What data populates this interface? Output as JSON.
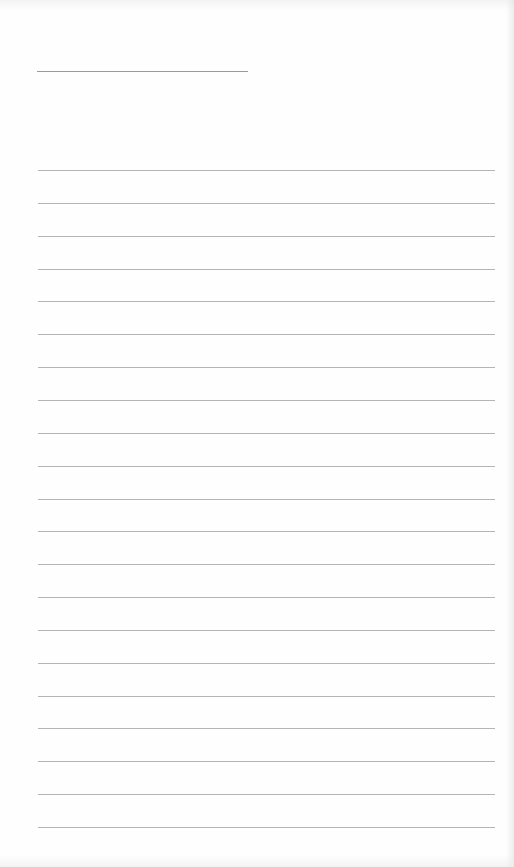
{
  "document": {
    "type": "lined-writing-page",
    "header_line": {
      "label": ""
    },
    "rule_count": 21,
    "rules": [
      {
        "index": 1,
        "text": ""
      },
      {
        "index": 2,
        "text": ""
      },
      {
        "index": 3,
        "text": ""
      },
      {
        "index": 4,
        "text": ""
      },
      {
        "index": 5,
        "text": ""
      },
      {
        "index": 6,
        "text": ""
      },
      {
        "index": 7,
        "text": ""
      },
      {
        "index": 8,
        "text": ""
      },
      {
        "index": 9,
        "text": ""
      },
      {
        "index": 10,
        "text": ""
      },
      {
        "index": 11,
        "text": ""
      },
      {
        "index": 12,
        "text": ""
      },
      {
        "index": 13,
        "text": ""
      },
      {
        "index": 14,
        "text": ""
      },
      {
        "index": 15,
        "text": ""
      },
      {
        "index": 16,
        "text": ""
      },
      {
        "index": 17,
        "text": ""
      },
      {
        "index": 18,
        "text": ""
      },
      {
        "index": 19,
        "text": ""
      },
      {
        "index": 20,
        "text": ""
      },
      {
        "index": 21,
        "text": ""
      }
    ],
    "colors": {
      "paper": "#fefefe",
      "rule": "#b4b4b4",
      "header_rule": "#9a9a9a"
    }
  }
}
